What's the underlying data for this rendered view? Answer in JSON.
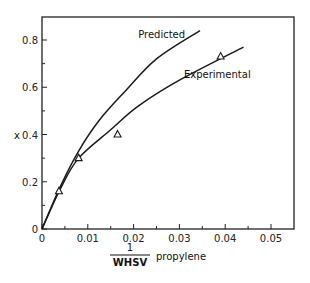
{
  "chart_data": {
    "type": "line",
    "title": "",
    "xlabel": {
      "numerator": "1",
      "denominator": "WHSV",
      "suffix": "propylene"
    },
    "ylabel": "x",
    "xlim": [
      0,
      0.055
    ],
    "ylim": [
      0,
      0.9
    ],
    "x_ticks": [
      "0",
      "0.01",
      "0.02",
      "0.03",
      "0.04",
      "0.05"
    ],
    "x_tick_values": [
      0,
      0.01,
      0.02,
      0.03,
      0.04,
      0.05
    ],
    "y_ticks": [
      "0",
      "0.2",
      "0.4",
      "0.6",
      "0.8"
    ],
    "y_tick_values": [
      0,
      0.2,
      0.4,
      0.6,
      0.8
    ],
    "grid": false,
    "legend": "inline labels",
    "series": [
      {
        "name": "Predicted",
        "style": "solid line",
        "x": [
          0,
          0.004,
          0.008,
          0.0125,
          0.018,
          0.025,
          0.0345
        ],
        "y": [
          0,
          0.18,
          0.33,
          0.46,
          0.58,
          0.72,
          0.84
        ]
      },
      {
        "name": "Experimental",
        "style": "solid line",
        "x": [
          0,
          0.004,
          0.008,
          0.015,
          0.021,
          0.03,
          0.044
        ],
        "y": [
          0,
          0.17,
          0.3,
          0.42,
          0.52,
          0.63,
          0.77
        ]
      },
      {
        "name": "Experimental data",
        "style": "triangle markers",
        "x": [
          0.0037,
          0.008,
          0.0165,
          0.039
        ],
        "y": [
          0.16,
          0.3,
          0.4,
          0.73
        ]
      }
    ],
    "annotations": [
      {
        "text": "Predicted",
        "x": 0.021,
        "y": 0.81
      },
      {
        "text": "Experimental",
        "x": 0.031,
        "y": 0.64
      }
    ]
  }
}
